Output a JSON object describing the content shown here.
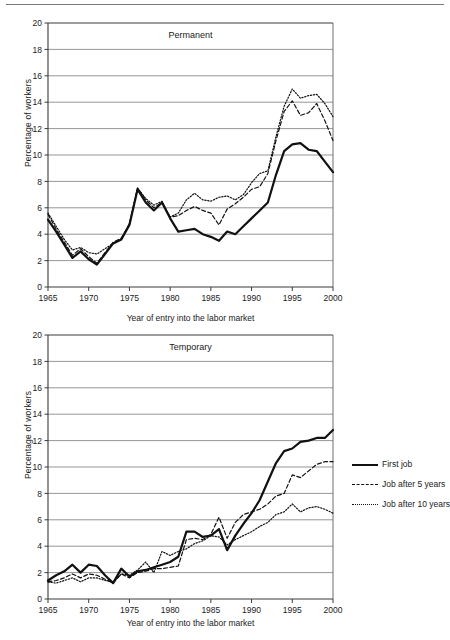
{
  "figure": {
    "rule_color": "#7b7b7b",
    "axis_label_x": "Year of entry into the labor market",
    "axis_label_y": "Percentage of workers"
  },
  "legend": {
    "position": "right",
    "items": [
      {
        "label": "First job",
        "style": "solid"
      },
      {
        "label": "Job after 5 years",
        "style": "dashed"
      },
      {
        "label": "Job after 10 years",
        "style": "dotted"
      }
    ]
  },
  "chart_data": [
    {
      "id": "permanent",
      "type": "line",
      "title": "Permanent",
      "xlabel": "Year of entry into the labor market",
      "ylabel": "Percentage of workers",
      "xlim": [
        1965,
        2000
      ],
      "ylim": [
        0,
        20
      ],
      "yticks": [
        0,
        2,
        4,
        6,
        8,
        10,
        12,
        14,
        16,
        18,
        20
      ],
      "xticks": [
        1965,
        1970,
        1975,
        1980,
        1985,
        1990,
        1995,
        2000
      ],
      "grid": "horizontal",
      "x": [
        1965,
        1966,
        1967,
        1968,
        1969,
        1970,
        1971,
        1972,
        1973,
        1974,
        1975,
        1976,
        1977,
        1978,
        1979,
        1980,
        1981,
        1982,
        1983,
        1984,
        1985,
        1986,
        1987,
        1988,
        1989,
        1990,
        1991,
        1992,
        1993,
        1994,
        1995,
        1996,
        1997,
        1998,
        1999,
        2000
      ],
      "series": [
        {
          "name": "First job",
          "style": "solid",
          "values": [
            5.1,
            4.2,
            3.2,
            2.2,
            2.7,
            2.1,
            1.7,
            2.5,
            3.3,
            3.6,
            4.7,
            7.4,
            6.4,
            5.8,
            6.4,
            5.2,
            4.2,
            4.3,
            4.4,
            4.0,
            3.8,
            3.5,
            4.2,
            4.0,
            4.6,
            5.2,
            5.8,
            6.4,
            8.5,
            10.3,
            10.8,
            10.9,
            10.4,
            10.3,
            9.5,
            8.7
          ]
        },
        {
          "name": "Job after 5 years",
          "style": "dashed",
          "values": [
            5.5,
            4.4,
            3.4,
            2.4,
            2.9,
            2.3,
            1.8,
            2.6,
            3.4,
            3.7,
            4.8,
            7.5,
            6.6,
            6.0,
            6.4,
            5.3,
            5.4,
            5.8,
            6.1,
            5.8,
            5.6,
            4.7,
            5.9,
            6.3,
            6.8,
            7.4,
            7.6,
            8.6,
            11.1,
            13.3,
            14.1,
            13.0,
            13.2,
            13.9,
            12.6,
            11.1
          ]
        },
        {
          "name": "Job after 10 years",
          "style": "dotted",
          "values": [
            5.6,
            4.6,
            3.6,
            2.8,
            3.0,
            2.6,
            2.5,
            2.9,
            3.3,
            3.6,
            4.8,
            7.5,
            6.7,
            6.2,
            6.5,
            5.3,
            5.6,
            6.6,
            7.1,
            6.6,
            6.5,
            6.8,
            6.9,
            6.6,
            7.0,
            7.9,
            8.6,
            8.8,
            11.4,
            13.7,
            15.0,
            14.3,
            14.5,
            14.6,
            13.9,
            12.9
          ]
        }
      ]
    },
    {
      "id": "temporary",
      "type": "line",
      "title": "Temporary",
      "xlabel": "Year of entry into the labor market",
      "ylabel": "Percentage of workers",
      "xlim": [
        1965,
        2000
      ],
      "ylim": [
        0,
        20
      ],
      "yticks": [
        0,
        2,
        4,
        6,
        8,
        10,
        12,
        14,
        16,
        18,
        20
      ],
      "xticks": [
        1965,
        1970,
        1975,
        1980,
        1985,
        1990,
        1995,
        2000
      ],
      "grid": "horizontal",
      "x": [
        1965,
        1966,
        1967,
        1968,
        1969,
        1970,
        1971,
        1972,
        1973,
        1974,
        1975,
        1976,
        1977,
        1978,
        1979,
        1980,
        1981,
        1982,
        1983,
        1984,
        1985,
        1986,
        1987,
        1988,
        1989,
        1990,
        1991,
        1992,
        1993,
        1994,
        1995,
        1996,
        1997,
        1998,
        1999,
        2000
      ],
      "series": [
        {
          "name": "First job",
          "style": "solid",
          "values": [
            1.4,
            1.8,
            2.1,
            2.6,
            2.0,
            2.6,
            2.5,
            1.8,
            1.2,
            2.3,
            1.7,
            2.1,
            2.2,
            2.4,
            2.6,
            2.8,
            3.2,
            5.1,
            5.1,
            4.7,
            4.8,
            5.3,
            3.7,
            4.8,
            5.7,
            6.5,
            7.5,
            8.9,
            10.3,
            11.2,
            11.4,
            11.9,
            12.0,
            12.2,
            12.2,
            12.8
          ]
        },
        {
          "name": "Job after 5 years",
          "style": "dashed",
          "values": [
            1.3,
            1.4,
            1.6,
            1.9,
            1.6,
            1.9,
            1.8,
            1.5,
            1.2,
            1.9,
            1.6,
            2.0,
            2.1,
            2.3,
            2.3,
            2.4,
            2.5,
            4.5,
            4.6,
            4.5,
            4.9,
            6.2,
            4.6,
            5.8,
            6.4,
            6.6,
            6.8,
            7.2,
            7.8,
            8.0,
            9.4,
            9.2,
            9.7,
            10.2,
            10.4,
            10.4
          ]
        },
        {
          "name": "Job after 10 years",
          "style": "dotted",
          "values": [
            1.3,
            1.2,
            1.4,
            1.6,
            1.3,
            1.6,
            1.6,
            1.4,
            1.3,
            1.9,
            1.8,
            2.2,
            2.8,
            2.0,
            3.6,
            3.3,
            3.6,
            3.8,
            4.2,
            4.4,
            4.8,
            4.7,
            4.1,
            4.5,
            4.8,
            5.1,
            5.5,
            5.8,
            6.4,
            6.6,
            7.2,
            6.6,
            6.9,
            7.0,
            6.8,
            6.5
          ]
        }
      ]
    }
  ]
}
